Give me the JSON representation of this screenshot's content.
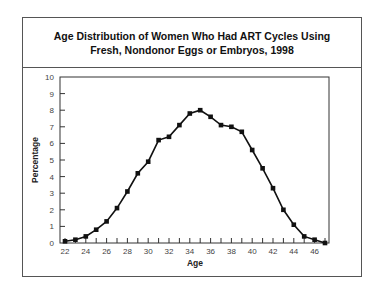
{
  "title": {
    "line1": "Age Distribution of Women Who Had ART Cycles Using",
    "line2": "Fresh, Nondonor Eggs or Embryos, 1998"
  },
  "chart_data": {
    "type": "line",
    "title": "Age Distribution of Women Who Had ART Cycles Using Fresh, Nondonor Eggs or Embryos, 1998",
    "xlabel": "Age",
    "ylabel": "Percentage",
    "x": [
      22,
      23,
      24,
      25,
      26,
      27,
      28,
      29,
      30,
      31,
      32,
      33,
      34,
      35,
      36,
      37,
      38,
      39,
      40,
      41,
      42,
      43,
      44,
      45,
      46,
      47
    ],
    "series": [
      {
        "name": "Percentage",
        "values": [
          0.1,
          0.2,
          0.4,
          0.8,
          1.3,
          2.1,
          3.1,
          4.2,
          4.9,
          6.2,
          6.4,
          7.1,
          7.8,
          8.0,
          7.6,
          7.1,
          7.0,
          6.7,
          5.6,
          4.5,
          3.3,
          2.0,
          1.1,
          0.4,
          0.2,
          0.0
        ]
      }
    ],
    "xticks": [
      22,
      23,
      24,
      25,
      26,
      27,
      28,
      29,
      30,
      31,
      32,
      33,
      34,
      35,
      36,
      37,
      38,
      39,
      40,
      41,
      42,
      43,
      44,
      45,
      46,
      47
    ],
    "xtick_labels": [
      "22",
      "24",
      "26",
      "28",
      "30",
      "32",
      "34",
      "36",
      "38",
      "40",
      "42",
      "44",
      "46"
    ],
    "yticks": [
      0,
      1,
      2,
      3,
      4,
      5,
      6,
      7,
      8,
      9,
      10
    ],
    "ytick_labels": [
      "0",
      "1",
      "2",
      "3",
      "4",
      "5",
      "6",
      "7",
      "8",
      "9",
      "10"
    ],
    "xlim": [
      22,
      47
    ],
    "ylim": [
      0,
      10
    ],
    "grid": false,
    "legend": "none",
    "marker": "square",
    "line_color": "#111111"
  }
}
